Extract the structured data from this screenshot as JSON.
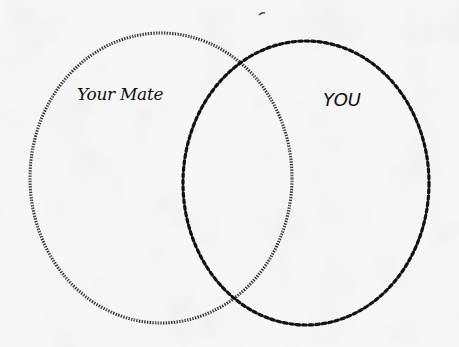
{
  "diagram": {
    "type": "venn",
    "sets": [
      {
        "label": "Your Mate",
        "style": "fine-dotted",
        "color": "#222222"
      },
      {
        "label": "YOU",
        "style": "bold-dotted",
        "color": "#111111"
      }
    ]
  }
}
